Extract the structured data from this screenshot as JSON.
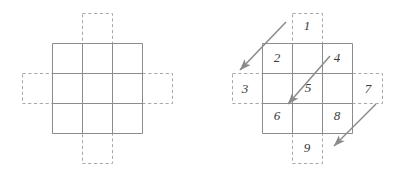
{
  "figure": {
    "title": "",
    "background_color": "#ffffff",
    "solid_line_color": "#8c8c8c",
    "dashed_line_color": "#a8a8a8",
    "arrow_color": "#8a8a8a",
    "label_color": "#3a3a3a",
    "panels": [
      {
        "name": "left-panel",
        "description": "3x3 solid grid with four dashed ghost cells on each side",
        "grid": {
          "x": 52,
          "y": 43,
          "size": 90,
          "rows": 3,
          "cols": 3
        },
        "ghost_cells": [
          {
            "name": "ghost-top",
            "x": 82,
            "y": 13,
            "w": 30,
            "h": 30
          },
          {
            "name": "ghost-left",
            "x": 22,
            "y": 73,
            "w": 30,
            "h": 30
          },
          {
            "name": "ghost-right",
            "x": 142,
            "y": 73,
            "w": 30,
            "h": 30
          },
          {
            "name": "ghost-bottom",
            "x": 82,
            "y": 133,
            "w": 30,
            "h": 30
          }
        ],
        "labels": []
      },
      {
        "name": "right-panel",
        "description": "3x3 solid grid with four dashed ghost cells, nine numbered labels and three diagonal arrows",
        "grid": {
          "x": 262,
          "y": 43,
          "size": 90,
          "rows": 3,
          "cols": 3
        },
        "ghost_cells": [
          {
            "name": "ghost-top",
            "x": 292,
            "y": 13,
            "w": 30,
            "h": 30
          },
          {
            "name": "ghost-left",
            "x": 232,
            "y": 73,
            "w": 30,
            "h": 30
          },
          {
            "name": "ghost-right",
            "x": 352,
            "y": 73,
            "w": 30,
            "h": 30
          },
          {
            "name": "ghost-bottom",
            "x": 292,
            "y": 133,
            "w": 30,
            "h": 30
          }
        ],
        "labels": [
          {
            "name": "label-1",
            "text": "1",
            "x": 307,
            "y": 27
          },
          {
            "name": "label-2",
            "text": "2",
            "x": 277,
            "y": 59
          },
          {
            "name": "label-3",
            "text": "3",
            "x": 245,
            "y": 90
          },
          {
            "name": "label-4",
            "text": "4",
            "x": 337,
            "y": 59
          },
          {
            "name": "label-5",
            "text": "5",
            "x": 308,
            "y": 89
          },
          {
            "name": "label-6",
            "text": "6",
            "x": 277,
            "y": 117
          },
          {
            "name": "label-7",
            "text": "7",
            "x": 368,
            "y": 90
          },
          {
            "name": "label-8",
            "text": "8",
            "x": 337,
            "y": 117
          },
          {
            "name": "label-9",
            "text": "9",
            "x": 307,
            "y": 149
          }
        ],
        "arrows": [
          {
            "name": "arrow-top-left",
            "x1": 286,
            "y1": 22,
            "x2": 240,
            "y2": 70
          },
          {
            "name": "arrow-middle",
            "x1": 330,
            "y1": 56,
            "x2": 288,
            "y2": 104
          },
          {
            "name": "arrow-bottom-right",
            "x1": 376,
            "y1": 104,
            "x2": 334,
            "y2": 146
          }
        ]
      }
    ]
  }
}
